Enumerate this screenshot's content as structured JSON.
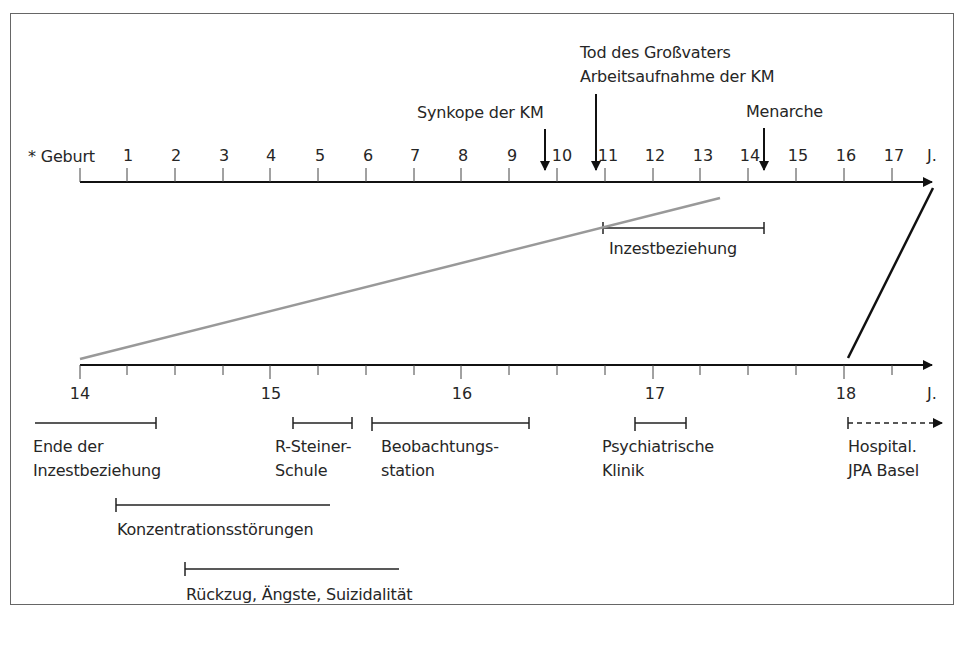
{
  "top_axis": {
    "start_label": "* Geburt",
    "ticks": [
      "1",
      "2",
      "3",
      "4",
      "5",
      "6",
      "7",
      "8",
      "9",
      "10",
      "11",
      "12",
      "13",
      "14",
      "15",
      "16",
      "17"
    ],
    "unit": "J."
  },
  "bottom_axis": {
    "ticks": [
      "14",
      "15",
      "16",
      "17",
      "18"
    ],
    "unit": "J."
  },
  "events": [
    {
      "label": "Synkope der KM",
      "age": 9.8
    },
    {
      "label": "Tod des Großvaters",
      "age": 10.9
    },
    {
      "label": "Arbeitsaufnahme der KM",
      "age": 10.9
    },
    {
      "label": "Menarche",
      "age": 14.3
    }
  ],
  "top_periods": [
    {
      "label": "Inzestbeziehung",
      "start": 10.9,
      "end": 14.3
    }
  ],
  "bottom_periods": [
    {
      "line1": "Ende der",
      "line2": "Inzestbeziehung",
      "start": 13.75,
      "end": 14.4
    },
    {
      "line1": "R-Steiner-",
      "line2": "Schule",
      "start": 15.12,
      "end": 15.42
    },
    {
      "line1": "Beobachtungs-",
      "line2": "station",
      "start": 15.53,
      "end": 16.35
    },
    {
      "line1": "Psychiatrische",
      "line2": "Klinik",
      "start": 16.9,
      "end": 17.17
    },
    {
      "line1": "Hospital.",
      "line2": "JPA Basel",
      "start": 18.0,
      "end": "ongoing"
    },
    {
      "line1": "Konzentrationsstörungen",
      "line2": "",
      "start": 14.2,
      "end": 15.3
    },
    {
      "line1": "Rückzug, Ängste, Suizidalität",
      "line2": "",
      "start": 14.55,
      "end": 15.65
    }
  ]
}
